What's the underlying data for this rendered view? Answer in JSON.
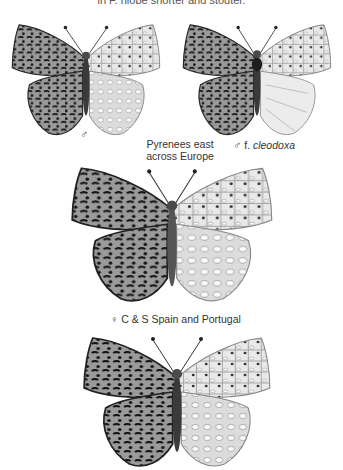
{
  "page": {
    "top_text": "in F. niobe shorter and stouter."
  },
  "plates": [
    {
      "id": "male-typical",
      "sex_symbol": "♂",
      "caption_line1": "Pyrenees east",
      "caption_line2": "across Europe"
    },
    {
      "id": "male-cleodoxa",
      "sex_symbol": "♂",
      "form_prefix": "f.",
      "form_name": "cleodoxa"
    },
    {
      "id": "female-spain",
      "sex_symbol": "♀",
      "caption": "C & S Spain and Portugal"
    },
    {
      "id": "male-spain",
      "sex_symbol": ""
    }
  ],
  "colors": {
    "background": "#ffffff",
    "wing_upper": "#8c8c8c",
    "wing_under": "#e2e2e2",
    "ink": "#1e1e1e"
  }
}
